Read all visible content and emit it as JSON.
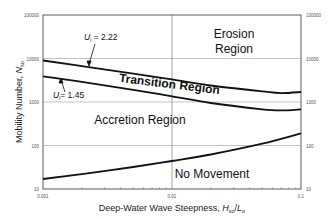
{
  "chart_data": {
    "type": "line",
    "title": "",
    "xlabel": "Deep-Water Wave Steepness, H_so/L_o",
    "ylabel": "Mobility Number, N_so",
    "xscale": "log",
    "yscale": "log",
    "xlim": [
      0.001,
      0.1
    ],
    "ylim": [
      10,
      100000
    ],
    "x_ticks": [
      "0.001",
      "0.01",
      "0.1"
    ],
    "y_ticks": [
      "10",
      "100",
      "1000",
      "10000",
      "100000"
    ],
    "y_ticks_right": [
      "10",
      "100",
      "1000",
      "10000",
      "100000"
    ],
    "grid": true,
    "series": [
      {
        "name": "U_i = 2.22",
        "x": [
          0.001,
          0.002,
          0.005,
          0.01,
          0.02,
          0.05,
          0.07,
          0.1
        ],
        "y": [
          9000,
          6700,
          4500,
          3300,
          2400,
          1750,
          1600,
          1700
        ]
      },
      {
        "name": "U_i = 1.45",
        "x": [
          0.001,
          0.002,
          0.005,
          0.01,
          0.02,
          0.05,
          0.07,
          0.1
        ],
        "y": [
          3900,
          2900,
          1900,
          1350,
          950,
          680,
          640,
          680
        ]
      },
      {
        "name": "No Movement boundary",
        "x": [
          0.001,
          0.002,
          0.005,
          0.01,
          0.02,
          0.05,
          0.1
        ],
        "y": [
          17,
          22,
          32,
          44,
          62,
          110,
          190
        ]
      }
    ],
    "annotations": [
      "Erosion Region",
      "Transition Region",
      "Accretion Region",
      "No Movement",
      "U_i = 2.22",
      "U_i = 1.45"
    ]
  },
  "labels": {
    "erosion_line1": "Erosion",
    "erosion_line2": "Region",
    "transition": "Transition Region",
    "accretion": "Accretion Region",
    "no_movement": "No Movement",
    "ui_upper_sym": "U",
    "ui_upper_sub": "i",
    "ui_upper_val": " = 2.22",
    "ui_lower_sym": "U",
    "ui_lower_sub": "i",
    "ui_lower_val": "= 1.45",
    "ylabel_main": "Mobility Number, ",
    "ylabel_sym": "N",
    "ylabel_sub": "so",
    "xlabel_main": "Deep-Water Wave Steepness, ",
    "xlabel_h": "H",
    "xlabel_hsub": "so",
    "xlabel_slash": "/",
    "xlabel_l": "L",
    "xlabel_lsub": "o"
  },
  "ticks": {
    "x": [
      "0.001",
      "0.01",
      "0.1"
    ],
    "y_left": [
      "100000",
      "10000",
      "1000",
      "100",
      "10"
    ],
    "y_right": [
      "100000",
      "10000",
      "1000",
      "100",
      "10"
    ]
  }
}
